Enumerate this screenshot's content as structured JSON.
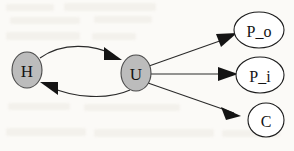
{
  "diagram": {
    "type": "directed-graph",
    "background_color": "#fbfaf7",
    "node_fill_shaded": "#bcbcbc",
    "node_fill_plain": "#ffffff",
    "edge_color": "#2a2a2a",
    "label_color": "#141414",
    "nodes": [
      {
        "id": "H",
        "label": "H",
        "shape": "ellipse",
        "style": "shaded",
        "cx": 27,
        "cy": 70,
        "rx": 15,
        "ry": 18,
        "font_size": 17
      },
      {
        "id": "U",
        "label": "U",
        "shape": "ellipse",
        "style": "shaded",
        "cx": 136,
        "cy": 73,
        "rx": 15,
        "ry": 18,
        "font_size": 17
      },
      {
        "id": "P_o",
        "label": "P_o",
        "shape": "ellipse",
        "style": "plain",
        "cx": 259,
        "cy": 30,
        "rx": 25,
        "ry": 18,
        "font_size": 16
      },
      {
        "id": "P_i",
        "label": "P_i",
        "shape": "ellipse",
        "style": "plain",
        "cx": 260,
        "cy": 75,
        "rx": 24,
        "ry": 18,
        "font_size": 16
      },
      {
        "id": "C",
        "label": "C",
        "shape": "ellipse",
        "style": "plain",
        "cx": 266,
        "cy": 120,
        "rx": 18,
        "ry": 17,
        "font_size": 16
      }
    ],
    "edges": [
      {
        "from": "H",
        "to": "U",
        "style": "curved",
        "direction": "forward"
      },
      {
        "from": "U",
        "to": "H",
        "style": "curved",
        "direction": "forward"
      },
      {
        "from": "U",
        "to": "P_o",
        "style": "straight",
        "direction": "forward"
      },
      {
        "from": "U",
        "to": "P_i",
        "style": "straight",
        "direction": "forward"
      },
      {
        "from": "U",
        "to": "C",
        "style": "straight",
        "direction": "forward"
      }
    ]
  }
}
